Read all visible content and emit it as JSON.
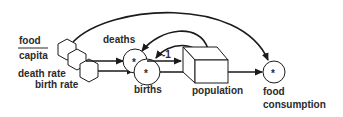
{
  "diagram": {
    "type": "stock-and-flow",
    "labels": {
      "food_capita_numerator": "food",
      "food_capita_denominator": "capita",
      "death_rate": "death rate",
      "birth_rate": "birth rate",
      "deaths": "deaths",
      "births": "births",
      "population": "population",
      "food_consumption_line1": "food",
      "food_consumption_line2": "consumption",
      "negative_sign": "-1",
      "multiply_symbol": "*"
    },
    "nodes": [
      {
        "id": "food-capita",
        "kind": "hexagon-constant"
      },
      {
        "id": "death-rate",
        "kind": "hexagon-constant"
      },
      {
        "id": "birth-rate",
        "kind": "hexagon-constant"
      },
      {
        "id": "deaths",
        "kind": "multiply-circle"
      },
      {
        "id": "births",
        "kind": "multiply-circle"
      },
      {
        "id": "population",
        "kind": "stock-box"
      },
      {
        "id": "food-consumption",
        "kind": "multiply-circle"
      }
    ],
    "edges": [
      {
        "from": "food-capita",
        "to": "food-consumption"
      },
      {
        "from": "death-rate",
        "to": "deaths"
      },
      {
        "from": "birth-rate",
        "to": "births"
      },
      {
        "from": "population",
        "to": "deaths"
      },
      {
        "from": "population",
        "to": "births"
      },
      {
        "from": "deaths",
        "to": "population",
        "label": "-1"
      },
      {
        "from": "births",
        "to": "population"
      },
      {
        "from": "population",
        "to": "food-consumption"
      }
    ],
    "colors": {
      "stroke": "#1a1a1a",
      "text": "#2a2a2a",
      "background": "#ffffff"
    }
  }
}
